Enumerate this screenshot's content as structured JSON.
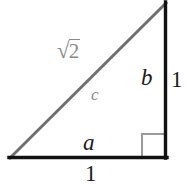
{
  "figure": {
    "kind": "right-triangle-diagram",
    "background_color": "#ffffff",
    "leg_color": "#1a1a1a",
    "hypotenuse_color": "#6f6f6f",
    "right_angle_marker_color": "#9a9a9a",
    "label_dark_color": "#1a1a1a",
    "label_gray_color": "#8a8a8a",
    "labels": {
      "side_a": "a",
      "side_b": "b",
      "side_c": "c",
      "hypotenuse_value": "2",
      "hypotenuse_radical": "√",
      "right_side_length": "1",
      "bottom_side_length": "1"
    },
    "geometry": {
      "bottom_left_vertex": "10,158",
      "bottom_right_vertex": "166,158",
      "top_right_vertex": "166,3",
      "right_angle_marker": "142,134 166,134 166,158 142,158",
      "right_tick_top": "166,66",
      "right_tick_bottom": "166,96"
    }
  }
}
